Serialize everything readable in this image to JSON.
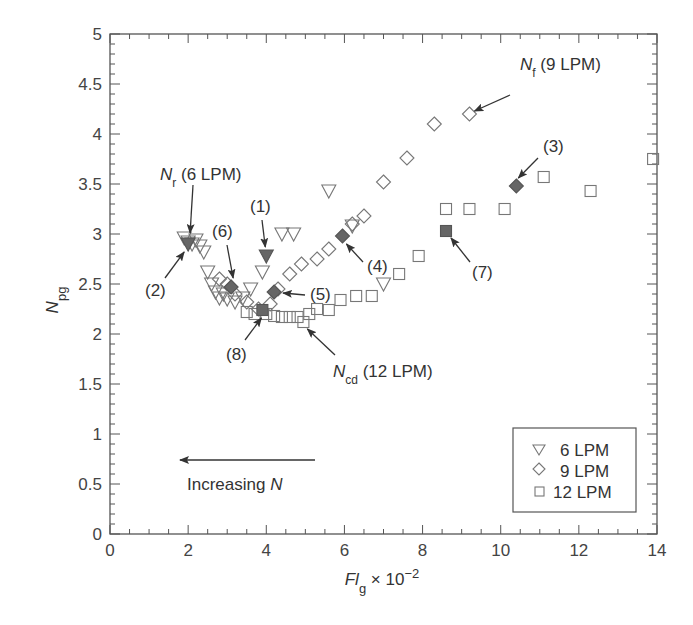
{
  "chart_data": {
    "type": "scatter",
    "title": "",
    "xlabel": "Fl_g × 10^-2",
    "ylabel": "N_pg",
    "xlim": [
      0,
      14
    ],
    "ylim": [
      0,
      5
    ],
    "x_ticks": [
      "0",
      "2",
      "4",
      "6",
      "8",
      "10",
      "12",
      "14"
    ],
    "y_ticks": [
      "0",
      "0.5",
      "1",
      "1.5",
      "2",
      "2.5",
      "3",
      "3.5",
      "4",
      "4.5",
      "5"
    ],
    "grid": false,
    "legend_position": "lower right",
    "legend": [
      {
        "marker": "triangle-down",
        "label": "6 LPM"
      },
      {
        "marker": "diamond",
        "label": "9 LPM"
      },
      {
        "marker": "square",
        "label": "12 LPM"
      }
    ],
    "series": [
      {
        "name": "6 LPM",
        "marker": "triangle-down",
        "points": [
          [
            1.9,
            2.96
          ],
          [
            2.0,
            2.92
          ],
          [
            2.1,
            2.9
          ],
          [
            2.2,
            2.94
          ],
          [
            2.3,
            2.88
          ],
          [
            2.4,
            2.82
          ],
          [
            2.5,
            2.62
          ],
          [
            2.6,
            2.5
          ],
          [
            2.7,
            2.42
          ],
          [
            2.8,
            2.36
          ],
          [
            2.9,
            2.4
          ],
          [
            3.0,
            2.35
          ],
          [
            3.2,
            2.32
          ],
          [
            3.4,
            2.36
          ],
          [
            3.6,
            2.45
          ],
          [
            3.9,
            2.62
          ],
          [
            4.4,
            3.0
          ],
          [
            4.7,
            3.0
          ],
          [
            5.6,
            3.43
          ],
          [
            6.2,
            3.08
          ],
          [
            7.0,
            2.5
          ]
        ],
        "highlighted": [
          {
            "label": "(1)",
            "x": 4.0,
            "y": 2.78
          },
          {
            "label": "(2)",
            "x": 2.0,
            "y": 2.9
          }
        ]
      },
      {
        "name": "9 LPM",
        "marker": "diamond",
        "points": [
          [
            2.8,
            2.55
          ],
          [
            3.0,
            2.5
          ],
          [
            3.2,
            2.4
          ],
          [
            3.5,
            2.32
          ],
          [
            3.8,
            2.25
          ],
          [
            4.1,
            2.3
          ],
          [
            4.3,
            2.45
          ],
          [
            4.6,
            2.6
          ],
          [
            4.9,
            2.7
          ],
          [
            5.3,
            2.75
          ],
          [
            5.6,
            2.85
          ],
          [
            6.2,
            3.1
          ],
          [
            6.5,
            3.18
          ],
          [
            7.0,
            3.52
          ],
          [
            7.6,
            3.76
          ],
          [
            8.3,
            4.1
          ],
          [
            9.2,
            4.2
          ]
        ],
        "highlighted": [
          {
            "label": "(3)",
            "x": 10.4,
            "y": 3.48
          },
          {
            "label": "(4)",
            "x": 5.95,
            "y": 2.98
          },
          {
            "label": "(5)",
            "x": 4.2,
            "y": 2.42
          },
          {
            "label": "(6)",
            "x": 3.1,
            "y": 2.47
          }
        ]
      },
      {
        "name": "12 LPM",
        "marker": "square",
        "points": [
          [
            3.5,
            2.22
          ],
          [
            3.7,
            2.2
          ],
          [
            4.0,
            2.2
          ],
          [
            4.2,
            2.18
          ],
          [
            4.4,
            2.17
          ],
          [
            4.6,
            2.17
          ],
          [
            4.8,
            2.17
          ],
          [
            4.95,
            2.12
          ],
          [
            5.1,
            2.2
          ],
          [
            5.3,
            2.25
          ],
          [
            5.6,
            2.24
          ],
          [
            5.9,
            2.34
          ],
          [
            6.3,
            2.38
          ],
          [
            6.7,
            2.38
          ],
          [
            7.4,
            2.6
          ],
          [
            7.9,
            2.78
          ],
          [
            8.6,
            3.25
          ],
          [
            9.2,
            3.25
          ],
          [
            10.1,
            3.25
          ],
          [
            11.1,
            3.57
          ],
          [
            12.3,
            3.43
          ],
          [
            13.9,
            3.75
          ]
        ],
        "highlighted": [
          {
            "label": "(7)",
            "x": 8.6,
            "y": 3.03
          },
          {
            "label": "(8)",
            "x": 3.9,
            "y": 2.24
          }
        ]
      }
    ],
    "annotations": [
      {
        "text": "N_f (9 LPM)",
        "points_to": [
          9.2,
          4.2
        ]
      },
      {
        "text": "N_r (6 LPM)",
        "points_to": [
          2.05,
          2.92
        ]
      },
      {
        "text": "N_cd (12 LPM)",
        "points_to": [
          4.95,
          2.12
        ]
      },
      {
        "text": "Increasing N",
        "arrow": "leftward"
      }
    ]
  },
  "labels": {
    "y_axis_main": "N",
    "y_axis_sub": "pg",
    "x_axis_main": "Fl",
    "x_axis_sub": "g",
    "x_axis_mult": " × 10",
    "x_axis_exp": "−2",
    "nf_main": "N",
    "nf_sub": "f",
    "nf_rest": " (9 LPM)",
    "nr_main": "N",
    "nr_sub": "r",
    "nr_rest": " (6 LPM)",
    "ncd_main": "N",
    "ncd_sub": "cd",
    "ncd_rest": " (12 LPM)",
    "increasing_text": "Increasing ",
    "increasing_var": "N",
    "legend_6": "6 LPM",
    "legend_9": "9 LPM",
    "legend_12": "12 LPM"
  },
  "colors": {
    "axis": "#555555",
    "marker_stroke": "#777777",
    "marker_fill_highlight": "#666666",
    "text": "#333333"
  }
}
